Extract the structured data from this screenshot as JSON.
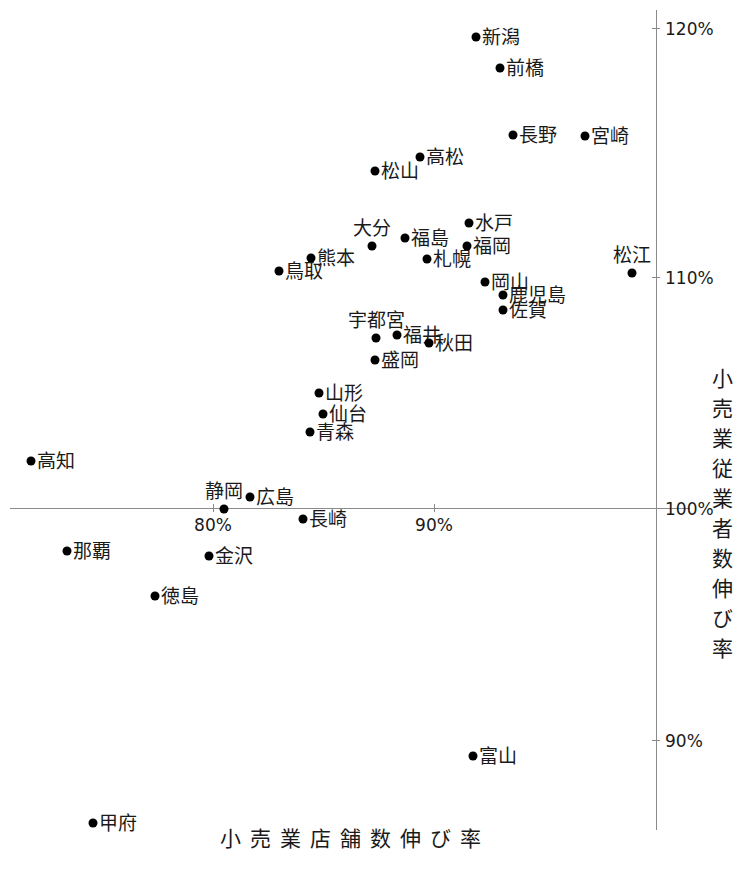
{
  "chart_data": {
    "type": "scatter",
    "title": "",
    "xlabel": "小売業店舗数伸び率",
    "ylabel": "小売業従業者数伸び率",
    "xlim": [
      74.0,
      101.5
    ],
    "ylim": [
      87.0,
      121.5
    ],
    "xticks": [
      "80%",
      "90%",
      "100%"
    ],
    "xtick_values": [
      80,
      90,
      100
    ],
    "yticks": [
      "90%",
      "100%",
      "110%",
      "120%"
    ],
    "ytick_values": [
      90,
      100,
      110,
      120
    ],
    "grid": false,
    "legend": null,
    "x_unit": "%",
    "y_unit": "%",
    "point_color": "#000000",
    "axis_color": "#8a8a8a",
    "points": [
      {
        "label": "新潟",
        "x": 91.9,
        "y": 120.2,
        "px": 476,
        "py": 37,
        "pos": "right"
      },
      {
        "label": "前橋",
        "x": 93.0,
        "y": 118.9,
        "px": 500,
        "py": 68,
        "pos": "right"
      },
      {
        "label": "長野",
        "x": 93.6,
        "y": 116.0,
        "px": 513,
        "py": 135,
        "pos": "right"
      },
      {
        "label": "宮崎",
        "x": 96.8,
        "y": 116.0,
        "px": 585,
        "py": 136,
        "pos": "right"
      },
      {
        "label": "高松",
        "x": 89.3,
        "y": 115.1,
        "px": 420,
        "py": 157,
        "pos": "right"
      },
      {
        "label": "松山",
        "x": 87.3,
        "y": 114.5,
        "px": 375,
        "py": 171,
        "pos": "right"
      },
      {
        "label": "水戸",
        "x": 91.5,
        "y": 112.2,
        "px": 469,
        "py": 223,
        "pos": "right"
      },
      {
        "label": "福島",
        "x": 88.6,
        "y": 111.6,
        "px": 405,
        "py": 238,
        "pos": "right"
      },
      {
        "label": "大分",
        "x": 87.2,
        "y": 111.2,
        "px": 372,
        "py": 246,
        "pos": "above"
      },
      {
        "label": "福岡",
        "x": 91.4,
        "y": 111.2,
        "px": 467,
        "py": 246,
        "pos": "right"
      },
      {
        "label": "熊本",
        "x": 84.4,
        "y": 110.7,
        "px": 311,
        "py": 258,
        "pos": "right"
      },
      {
        "label": "札幌",
        "x": 89.6,
        "y": 110.7,
        "px": 427,
        "py": 259,
        "pos": "right"
      },
      {
        "label": "鳥取",
        "x": 83.0,
        "y": 110.2,
        "px": 279,
        "py": 271,
        "pos": "right"
      },
      {
        "label": "松江",
        "x": 98.9,
        "y": 110.1,
        "px": 632,
        "py": 273,
        "pos": "above"
      },
      {
        "label": "岡山",
        "x": 92.3,
        "y": 109.7,
        "px": 485,
        "py": 282,
        "pos": "right"
      },
      {
        "label": "鹿児島",
        "x": 93.1,
        "y": 109.2,
        "px": 503,
        "py": 295,
        "pos": "right"
      },
      {
        "label": "佐賀",
        "x": 93.1,
        "y": 108.5,
        "px": 503,
        "py": 310,
        "pos": "right"
      },
      {
        "label": "福井",
        "x": 87.3,
        "y": 107.4,
        "px": 397,
        "py": 335,
        "pos": "right"
      },
      {
        "label": "宇都宮",
        "x": 86.4,
        "y": 107.3,
        "px": 376,
        "py": 338,
        "pos": "above"
      },
      {
        "label": "秋田",
        "x": 88.7,
        "y": 107.1,
        "px": 429,
        "py": 343,
        "pos": "right"
      },
      {
        "label": "盛岡",
        "x": 86.3,
        "y": 106.4,
        "px": 375,
        "py": 360,
        "pos": "right"
      },
      {
        "label": "山形",
        "x": 83.8,
        "y": 104.9,
        "px": 319,
        "py": 393,
        "pos": "right"
      },
      {
        "label": "仙台",
        "x": 84.0,
        "y": 104.0,
        "px": 323,
        "py": 414,
        "pos": "right"
      },
      {
        "label": "青森",
        "x": 83.4,
        "y": 103.3,
        "px": 310,
        "py": 432,
        "pos": "right"
      },
      {
        "label": "高知",
        "x": 71.8,
        "y": 102.0,
        "px": 31,
        "py": 461,
        "pos": "right"
      },
      {
        "label": "広島",
        "x": 81.7,
        "y": 100.5,
        "px": 250,
        "py": 497,
        "pos": "right"
      },
      {
        "label": "静岡",
        "x": 80.5,
        "y": 100.0,
        "px": 224,
        "py": 509,
        "pos": "above"
      },
      {
        "label": "長崎",
        "x": 84.0,
        "y": 99.5,
        "px": 303,
        "py": 519,
        "pos": "right"
      },
      {
        "label": "那覇",
        "x": 73.4,
        "y": 98.2,
        "px": 67,
        "py": 551,
        "pos": "right"
      },
      {
        "label": "金沢",
        "x": 79.9,
        "y": 98.0,
        "px": 209,
        "py": 556,
        "pos": "right"
      },
      {
        "label": "徳島",
        "x": 77.5,
        "y": 96.2,
        "px": 155,
        "py": 596,
        "pos": "right"
      },
      {
        "label": "富山",
        "x": 91.7,
        "y": 89.3,
        "px": 473,
        "py": 756,
        "pos": "right"
      },
      {
        "label": "甲府",
        "x": 74.6,
        "y": 86.4,
        "px": 93,
        "py": 823,
        "pos": "right"
      }
    ]
  },
  "axes": {
    "x_axis_y_px": 508,
    "x_axis_left_px": 10,
    "x_axis_right_px": 690,
    "y_axis_x_px": 656,
    "y_axis_top_px": 10,
    "y_axis_bottom_px": 830,
    "x_ticks": [
      {
        "label": "80%",
        "px": 213
      },
      {
        "label": "90%",
        "px": 434
      }
    ],
    "y_ticks": [
      {
        "label": "120%",
        "py": 28
      },
      {
        "label": "110%",
        "py": 277
      },
      {
        "label": "100%",
        "py": 508
      },
      {
        "label": "90%",
        "py": 740
      }
    ],
    "x_title": "小売業店舗数伸び率",
    "y_title": "小売業従業者数伸び率",
    "x_title_px": 355,
    "x_title_py": 822,
    "y_title_px": 706,
    "y_title_py": 368
  }
}
